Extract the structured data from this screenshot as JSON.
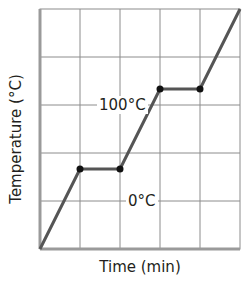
{
  "chart_data": {
    "type": "line",
    "title": "",
    "xlabel": "Time (min)",
    "ylabel": "Temperature (°C)",
    "grid": true,
    "grid_columns": 5,
    "grid_rows": 5,
    "x": [
      0,
      1,
      2,
      3,
      4,
      5
    ],
    "series": [
      {
        "name": "Heating curve",
        "values": [
          -100,
          0,
          0,
          100,
          100,
          200
        ]
      }
    ],
    "markers": [
      {
        "x": 1,
        "y": 0
      },
      {
        "x": 2,
        "y": 0
      },
      {
        "x": 3,
        "y": 100
      },
      {
        "x": 4,
        "y": 100
      }
    ],
    "annotations": [
      {
        "text": "0°C",
        "x": 2,
        "y": 0
      },
      {
        "text": "100°C",
        "x": 3,
        "y": 100
      }
    ],
    "xlim": [
      0,
      5
    ],
    "ylim": [
      -100,
      200
    ],
    "line_color": "#555555",
    "grid_color": "#8c8c8c"
  }
}
